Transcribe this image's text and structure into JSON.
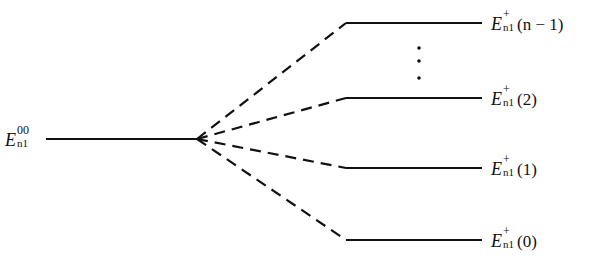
{
  "diagram": {
    "type": "energy-level-splitting",
    "line_color": "#111111",
    "left_level": {
      "label": {
        "symbol": "E",
        "superscript": "00",
        "subscript": "n1"
      },
      "x1": 46,
      "x2": 197,
      "y": 139
    },
    "split_point": {
      "x": 197,
      "y": 139
    },
    "right_levels": [
      {
        "label": {
          "symbol": "E",
          "superscript": "+",
          "subscript": "n1",
          "argument": "(n − 1)"
        },
        "y": 23,
        "x1": 346,
        "x2": 482
      },
      {
        "label": {
          "symbol": "E",
          "superscript": "+",
          "subscript": "n1",
          "argument": "(2)"
        },
        "y": 98,
        "x1": 346,
        "x2": 482
      },
      {
        "label": {
          "symbol": "E",
          "superscript": "+",
          "subscript": "n1",
          "argument": "(1)"
        },
        "y": 168,
        "x1": 346,
        "x2": 482
      },
      {
        "label": {
          "symbol": "E",
          "superscript": "+",
          "subscript": "n1",
          "argument": "(0)"
        },
        "y": 240,
        "x1": 346,
        "x2": 482
      }
    ],
    "ellipsis": {
      "x": 419,
      "dots_y": [
        48,
        61,
        78
      ]
    }
  }
}
